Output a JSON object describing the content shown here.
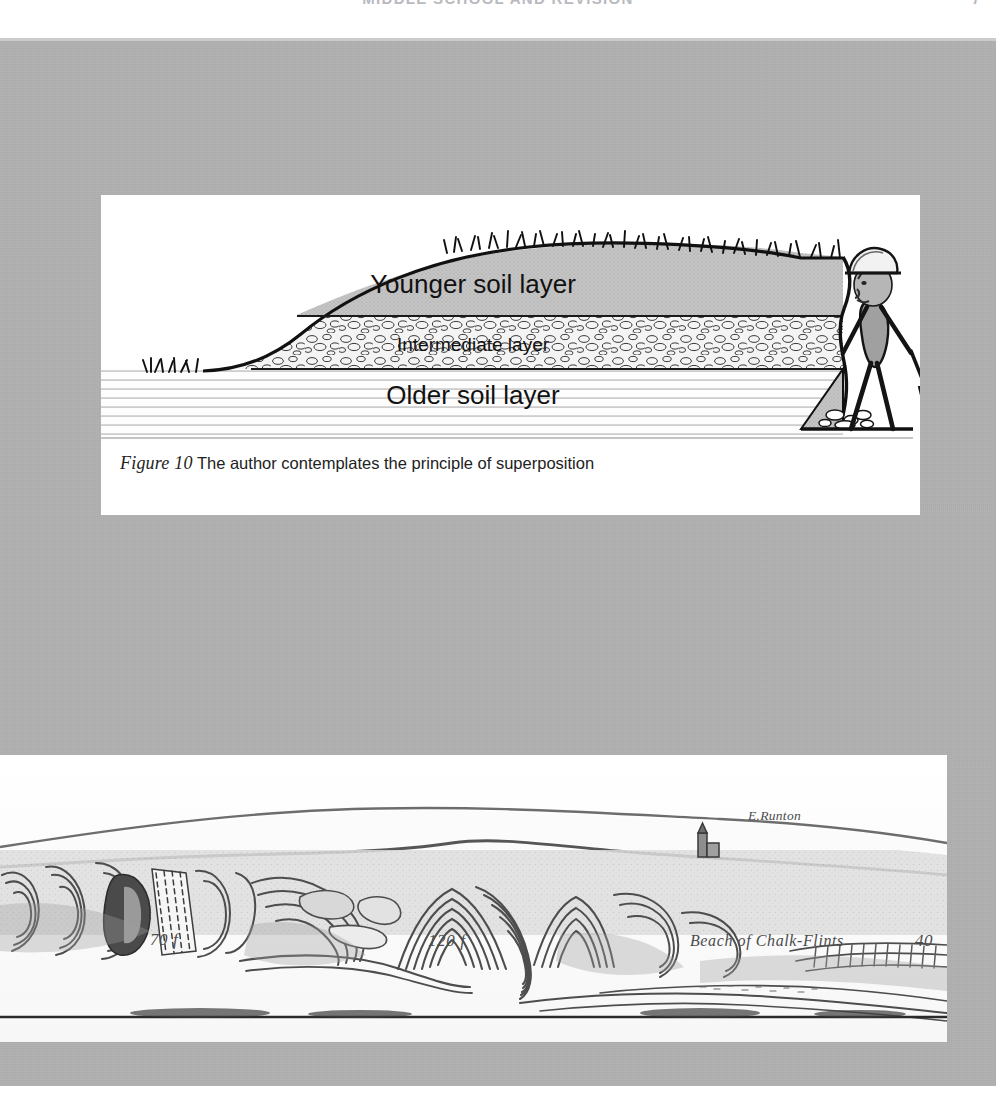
{
  "page": {
    "running_head": "MIDDLE SCHOOL AND REVISION",
    "folio": "7",
    "background_color": "#ababab",
    "paper_color": "#ffffff"
  },
  "figure": {
    "caption_label": "Figure 10",
    "caption_text": "The author contemplates the principle of superposition",
    "layers": [
      {
        "id": "younger",
        "label": "Younger soil layer",
        "fill": "#c9c9c9",
        "pattern": "stipple"
      },
      {
        "id": "intermediate",
        "label": "Intermediate layer",
        "fill": "#f2f2f2",
        "pattern": "pebbles"
      },
      {
        "id": "older",
        "label": "Older soil layer",
        "fill": "#fdfdfd",
        "pattern": "horizontal-strata"
      }
    ],
    "person": {
      "name": "author-figure",
      "items": [
        "hard-hat",
        "shovel"
      ],
      "body_fill": "#9a9a9a"
    },
    "scene_items": [
      "grass-tufts",
      "spoil-heap",
      "excavation-trench",
      "ground-line"
    ]
  },
  "plate": {
    "locality_label": "E.Runton",
    "scale_labels": [
      "70 f",
      "120 f"
    ],
    "beach_label": "Beach of Chalk-Flints",
    "plate_number": "40",
    "subject": "contorted-drift-geological-section",
    "ink_color": "#5a5a5a"
  }
}
